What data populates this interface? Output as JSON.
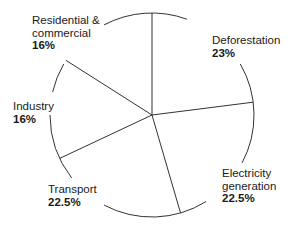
{
  "chart_data": {
    "type": "pie",
    "title": "",
    "start_angle_deg": 0,
    "direction": "clockwise",
    "categories": [
      "Deforestation",
      "Electricity generation",
      "Transport",
      "Industry",
      "Residential & commercial"
    ],
    "values": [
      23,
      22.5,
      22.5,
      16,
      16
    ],
    "unit": "%",
    "legend": "none (direct labels)",
    "colors": {
      "fill": "#ffffff",
      "stroke": "#333333"
    }
  },
  "labels": {
    "deforestation": {
      "name_lines": [
        "Deforestation"
      ],
      "pct": "23%"
    },
    "electricity": {
      "name_lines": [
        "Electricity",
        "generation"
      ],
      "pct": "22.5%"
    },
    "transport": {
      "name_lines": [
        "Transport"
      ],
      "pct": "22.5%"
    },
    "industry": {
      "name_lines": [
        "Industry"
      ],
      "pct": "16%"
    },
    "residential": {
      "name_lines": [
        "Residential &",
        "commercial"
      ],
      "pct": "16%"
    }
  }
}
